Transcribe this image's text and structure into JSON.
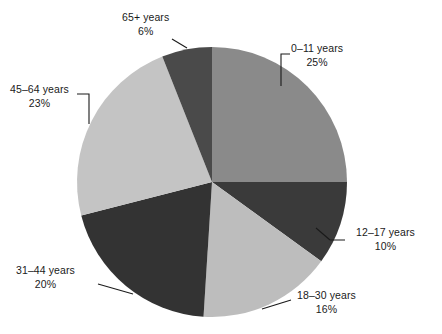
{
  "chart_data": {
    "type": "pie",
    "title": "",
    "xlabel": "",
    "ylabel": "",
    "legend": "none",
    "grid": false,
    "label_position": "outside-with-leader-lines",
    "start_angle_deg": 0,
    "direction": "clockwise",
    "units": "percent",
    "total": 100,
    "categories": [
      "0–11 years",
      "12–17 years",
      "18–30 years",
      "31–44 years",
      "45–64 years",
      "65+ years"
    ],
    "values": [
      25,
      10,
      16,
      20,
      23,
      6
    ],
    "value_labels": [
      "25%",
      "10%",
      "16%",
      "20%",
      "23%",
      "6%"
    ],
    "colors": [
      "#8a8a8a",
      "#3a3a3a",
      "#bdbdbd",
      "#333333",
      "#c4c4c4",
      "#4a4a4a"
    ],
    "slices": [
      {
        "label": "0–11 years",
        "value": 25,
        "value_label": "25%",
        "color": "#8a8a8a"
      },
      {
        "label": "12–17 years",
        "value": 10,
        "value_label": "10%",
        "color": "#3a3a3a"
      },
      {
        "label": "18–30 years",
        "value": 16,
        "value_label": "16%",
        "color": "#bdbdbd"
      },
      {
        "label": "31–44 years",
        "value": 20,
        "value_label": "20%",
        "color": "#333333"
      },
      {
        "label": "45–64 years",
        "value": 23,
        "value_label": "23%",
        "color": "#c4c4c4"
      },
      {
        "label": "65+ years",
        "value": 6,
        "value_label": "6%",
        "color": "#4a4a4a"
      }
    ]
  },
  "canvas": {
    "background": "#ffffff",
    "text_color": "#1a1a1a",
    "leader_color": "#1a1a1a",
    "center_x": 212,
    "center_y": 182,
    "radius": 135
  }
}
